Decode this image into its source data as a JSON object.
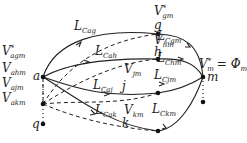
{
  "diagram": {
    "nodes": {
      "a": {
        "label": "a"
      },
      "g": {
        "label": "g",
        "voltage": "V",
        "voltage_sub": "gm",
        "voltage_sup": "*"
      },
      "h": {
        "label": "h",
        "voltage": "V",
        "voltage_sub": "hm"
      },
      "j": {
        "label": "j",
        "voltage": "V",
        "voltage_sub": "jm"
      },
      "k": {
        "label": "k",
        "voltage": "V",
        "voltage_sub": "km"
      },
      "m": {
        "label": "m",
        "voltage": "V",
        "voltage_sub": "m",
        "voltage_sup": "*",
        "equals": "= Φ",
        "phi_sub": "m"
      },
      "q": {
        "label": "q"
      }
    },
    "a_voltages": [
      {
        "main": "V",
        "sub": "agm",
        "sup": "*"
      },
      {
        "main": "V",
        "sub": "ahm",
        "sup": ""
      },
      {
        "main": "V",
        "sub": "ajm",
        "sup": ""
      },
      {
        "main": "V",
        "sub": "akm",
        "sup": ""
      }
    ],
    "edges_left": [
      {
        "main": "L",
        "sub": "Cag"
      },
      {
        "main": "L",
        "sub": "Cah"
      },
      {
        "main": "L",
        "sub": "Caj"
      },
      {
        "main": "L",
        "sub": "Cak"
      }
    ],
    "edges_right": [
      {
        "main": "L",
        "sub": "Cgm"
      },
      {
        "main": "L",
        "sub": "Chm"
      },
      {
        "main": "L",
        "sub": "Cjm"
      },
      {
        "main": "L",
        "sub": "Ckm"
      }
    ]
  }
}
